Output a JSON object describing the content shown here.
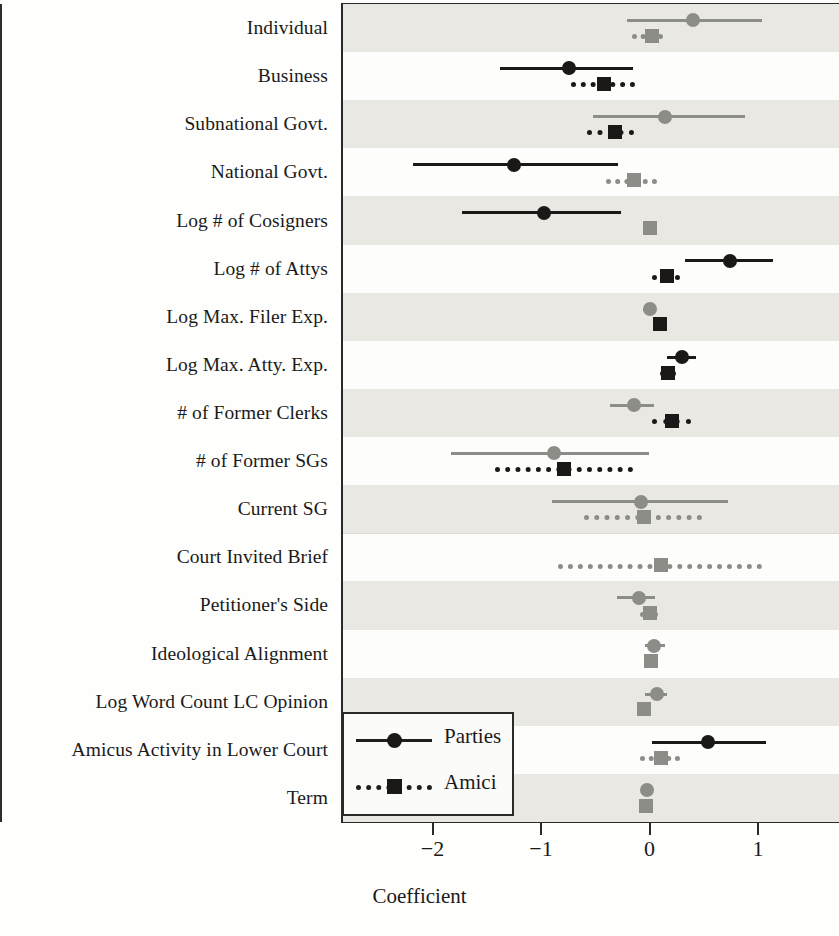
{
  "chart_data": {
    "type": "scatter",
    "subtype": "coefficient-dot-and-whisker-plot",
    "title": "",
    "xlabel": "Coefficient",
    "ylabel": "",
    "xlim": [
      -2.85,
      1.75
    ],
    "xticks": [
      -2,
      -1,
      0,
      1
    ],
    "xticklabels": [
      "−2",
      "−1",
      "0",
      "1"
    ],
    "grid": false,
    "zero_reference_line": 0,
    "legend": {
      "position": "bottom-left-inside",
      "entries": [
        {
          "label": "Parties",
          "marker": "circle",
          "line": "solid"
        },
        {
          "label": "Amici",
          "marker": "square",
          "line": "dotted"
        }
      ]
    },
    "categories": [
      "Individual",
      "Business",
      "Subnational Govt.",
      "National Govt.",
      "Log # of Cosigners",
      "Log # of Attys",
      "Log Max. Filer Exp.",
      "Log Max. Atty. Exp.",
      "# of Former Clerks",
      "# of Former SGs",
      "Current SG",
      "Court Invited Brief",
      "Petitioner's Side",
      "Ideological Alignment",
      "Log Word Count LC Opinion",
      "Amicus Activity in Lower Court",
      "Term"
    ],
    "group_separator_after": "Current SG",
    "series": [
      {
        "name": "Parties",
        "marker": "circle",
        "linestyle": "solid",
        "points": [
          {
            "category": "Individual",
            "estimate": 0.4,
            "ci_low": -0.21,
            "ci_high": 1.04,
            "significant": false
          },
          {
            "category": "Business",
            "estimate": -0.74,
            "ci_low": -1.38,
            "ci_high": -0.15,
            "significant": true
          },
          {
            "category": "Subnational Govt.",
            "estimate": 0.14,
            "ci_low": -0.52,
            "ci_high": 0.88,
            "significant": false
          },
          {
            "category": "National Govt.",
            "estimate": -1.25,
            "ci_low": -2.18,
            "ci_high": -0.29,
            "significant": true
          },
          {
            "category": "Log # of Cosigners",
            "estimate": -0.97,
            "ci_low": -1.73,
            "ci_high": -0.26,
            "significant": true
          },
          {
            "category": "Log # of Attys",
            "estimate": 0.74,
            "ci_low": 0.33,
            "ci_high": 1.14,
            "significant": true
          },
          {
            "category": "Log Max. Filer Exp.",
            "estimate": 0.0,
            "ci_low": -0.06,
            "ci_high": 0.05,
            "significant": false
          },
          {
            "category": "Log Max. Atty. Exp.",
            "estimate": 0.3,
            "ci_low": 0.16,
            "ci_high": 0.43,
            "significant": true
          },
          {
            "category": "# of Former Clerks",
            "estimate": -0.14,
            "ci_low": -0.36,
            "ci_high": 0.04,
            "significant": false
          },
          {
            "category": "# of Former SGs",
            "estimate": -0.88,
            "ci_low": -1.83,
            "ci_high": 0.0,
            "significant": false
          },
          {
            "category": "Current SG",
            "estimate": -0.08,
            "ci_low": -0.9,
            "ci_high": 0.72,
            "significant": false
          },
          {
            "category": "Court Invited Brief",
            "estimate": null,
            "ci_low": null,
            "ci_high": null,
            "significant": false
          },
          {
            "category": "Petitioner's Side",
            "estimate": -0.1,
            "ci_low": -0.3,
            "ci_high": 0.05,
            "significant": false
          },
          {
            "category": "Ideological Alignment",
            "estimate": 0.04,
            "ci_low": -0.04,
            "ci_high": 0.14,
            "significant": false
          },
          {
            "category": "Log Word Count LC Opinion",
            "estimate": 0.07,
            "ci_low": -0.04,
            "ci_high": 0.16,
            "significant": false
          },
          {
            "category": "Amicus Activity in Lower Court",
            "estimate": 0.54,
            "ci_low": 0.02,
            "ci_high": 1.07,
            "significant": true
          },
          {
            "category": "Term",
            "estimate": -0.02,
            "ci_low": -0.04,
            "ci_high": 0.01,
            "significant": false
          }
        ]
      },
      {
        "name": "Amici",
        "marker": "square",
        "linestyle": "dotted",
        "points": [
          {
            "category": "Individual",
            "estimate": 0.02,
            "ci_low": -0.16,
            "ci_high": 0.12,
            "significant": false
          },
          {
            "category": "Business",
            "estimate": -0.42,
            "ci_low": -0.72,
            "ci_high": -0.13,
            "significant": true
          },
          {
            "category": "Subnational Govt.",
            "estimate": -0.32,
            "ci_low": -0.58,
            "ci_high": -0.14,
            "significant": true
          },
          {
            "category": "National Govt.",
            "estimate": -0.14,
            "ci_low": -0.4,
            "ci_high": 0.07,
            "significant": false
          },
          {
            "category": "Log # of Cosigners",
            "estimate": 0.0,
            "ci_low": -0.03,
            "ci_high": 0.03,
            "significant": false
          },
          {
            "category": "Log # of Attys",
            "estimate": 0.16,
            "ci_low": 0.02,
            "ci_high": 0.28,
            "significant": true
          },
          {
            "category": "Log Max. Filer Exp.",
            "estimate": 0.1,
            "ci_low": 0.05,
            "ci_high": 0.15,
            "significant": true
          },
          {
            "category": "Log Max. Atty. Exp.",
            "estimate": 0.17,
            "ci_low": 0.1,
            "ci_high": 0.24,
            "significant": true
          },
          {
            "category": "# of Former Clerks",
            "estimate": 0.21,
            "ci_low": 0.02,
            "ci_high": 0.38,
            "significant": true
          },
          {
            "category": "# of Former SGs",
            "estimate": -0.79,
            "ci_low": -1.42,
            "ci_high": -0.15,
            "significant": true
          },
          {
            "category": "Current SG",
            "estimate": -0.05,
            "ci_low": -0.6,
            "ci_high": 0.48,
            "significant": false
          },
          {
            "category": "Court Invited Brief",
            "estimate": 0.11,
            "ci_low": -0.84,
            "ci_high": 1.04,
            "significant": false
          },
          {
            "category": "Petitioner's Side",
            "estimate": 0.0,
            "ci_low": -0.09,
            "ci_high": 0.08,
            "significant": false
          },
          {
            "category": "Ideological Alignment",
            "estimate": 0.01,
            "ci_low": -0.03,
            "ci_high": 0.05,
            "significant": false
          },
          {
            "category": "Log Word Count LC Opinion",
            "estimate": -0.05,
            "ci_low": -0.1,
            "ci_high": 0.01,
            "significant": false
          },
          {
            "category": "Amicus Activity in Lower Court",
            "estimate": 0.11,
            "ci_low": -0.09,
            "ci_high": 0.28,
            "significant": false
          },
          {
            "category": "Term",
            "estimate": -0.03,
            "ci_low": -0.06,
            "ci_high": 0.0,
            "significant": false
          }
        ]
      }
    ],
    "colors": {
      "significant": "#1b1918",
      "nonsignificant": "#8d8d88",
      "band": "#e9e8e2",
      "frame": "#2a2a28",
      "background": "#fdfdfb"
    }
  }
}
